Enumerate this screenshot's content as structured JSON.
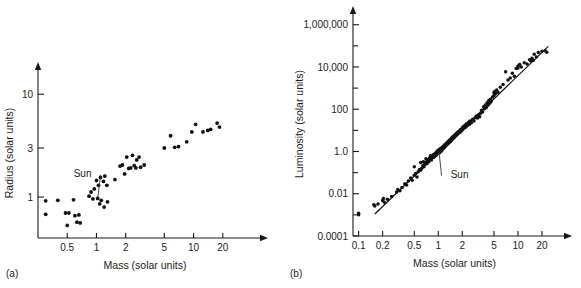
{
  "figure": {
    "panel_a_label": "(a)",
    "panel_b_label": "(b)"
  },
  "chart_data": [
    {
      "id": "panel-a",
      "type": "scatter",
      "title": "",
      "xlabel": "Mass (solar units)",
      "ylabel": "Radius (solar units)",
      "xscale": "log",
      "yscale": "log",
      "xlim": [
        0.25,
        40
      ],
      "ylim": [
        0.4,
        18
      ],
      "xticks": [
        0.5,
        1,
        2,
        5,
        10,
        20
      ],
      "xticklabels": [
        "0.5",
        "1",
        "2",
        "5",
        "10",
        "20"
      ],
      "yticks": [
        1,
        3,
        10
      ],
      "yticklabels": [
        "1",
        "3",
        "10"
      ],
      "grid": false,
      "legend": "none",
      "annotations": [
        {
          "text": "Sun",
          "x": 0.72,
          "y": 1.72,
          "point_x": 1.03,
          "point_y": 0.97
        }
      ],
      "points": [
        [
          0.3,
          0.92
        ],
        [
          0.3,
          0.68
        ],
        [
          0.4,
          0.93
        ],
        [
          0.48,
          0.7
        ],
        [
          0.5,
          0.53
        ],
        [
          0.52,
          0.7
        ],
        [
          0.58,
          0.94
        ],
        [
          0.6,
          0.66
        ],
        [
          0.63,
          0.57
        ],
        [
          0.66,
          0.67
        ],
        [
          0.68,
          0.56
        ],
        [
          0.84,
          1.02
        ],
        [
          0.88,
          1.12
        ],
        [
          0.92,
          0.96
        ],
        [
          0.95,
          1.2
        ],
        [
          1.0,
          1.45
        ],
        [
          1.03,
          0.97
        ],
        [
          1.05,
          1.3
        ],
        [
          1.08,
          0.86
        ],
        [
          1.1,
          1.55
        ],
        [
          1.12,
          0.93
        ],
        [
          1.18,
          1.42
        ],
        [
          1.2,
          0.8
        ],
        [
          1.22,
          1.6
        ],
        [
          1.28,
          1.3
        ],
        [
          1.3,
          0.9
        ],
        [
          1.55,
          1.48
        ],
        [
          1.75,
          2.0
        ],
        [
          1.85,
          2.05
        ],
        [
          1.95,
          1.68
        ],
        [
          2.05,
          2.45
        ],
        [
          2.15,
          1.9
        ],
        [
          2.25,
          1.92
        ],
        [
          2.35,
          2.55
        ],
        [
          2.45,
          2.02
        ],
        [
          2.55,
          1.92
        ],
        [
          2.6,
          2.3
        ],
        [
          2.75,
          2.45
        ],
        [
          2.85,
          1.95
        ],
        [
          3.1,
          2.05
        ],
        [
          5.0,
          3.0
        ],
        [
          5.8,
          3.95
        ],
        [
          6.4,
          3.05
        ],
        [
          7.0,
          3.1
        ],
        [
          8.5,
          3.45
        ],
        [
          9.6,
          4.3
        ],
        [
          10.5,
          5.1
        ],
        [
          12.5,
          4.3
        ],
        [
          14.0,
          4.45
        ],
        [
          15.0,
          4.55
        ],
        [
          17.5,
          5.25
        ],
        [
          18.5,
          4.8
        ]
      ]
    },
    {
      "id": "panel-b",
      "type": "scatter",
      "title": "",
      "xlabel": "Mass (solar units)",
      "ylabel": "Luminosity (solar units)",
      "xscale": "log",
      "yscale": "log",
      "xlim": [
        0.085,
        30
      ],
      "ylim": [
        0.0001,
        4000000
      ],
      "xticks": [
        0.1,
        0.2,
        0.5,
        1,
        2,
        5,
        10,
        20
      ],
      "xticklabels": [
        "0.1",
        "0.2",
        "0.5",
        "1",
        "2",
        "5",
        "10",
        "20"
      ],
      "yticks": [
        0.0001,
        0.01,
        1.0,
        100,
        10000,
        1000000
      ],
      "yticklabels": [
        "0.0001",
        "0.01",
        "1.0",
        "100",
        "10,000",
        "1,000,000"
      ],
      "yminorticks": [
        0.001,
        0.1,
        10,
        1000,
        100000
      ],
      "grid": false,
      "legend": "none",
      "fit_line": {
        "x1": 0.16,
        "y1": 0.0011,
        "x2": 24.0,
        "y2": 95000
      },
      "annotations": [
        {
          "text": "Sun",
          "x": 1.85,
          "y": 0.09,
          "point_x": 1.02,
          "point_y": 1.0
        }
      ],
      "points": [
        [
          0.1,
          0.0012
        ],
        [
          0.1,
          0.001
        ],
        [
          0.155,
          0.003
        ],
        [
          0.16,
          0.0026
        ],
        [
          0.175,
          0.0033
        ],
        [
          0.2,
          0.0048
        ],
        [
          0.205,
          0.006
        ],
        [
          0.21,
          0.004
        ],
        [
          0.23,
          0.0055
        ],
        [
          0.26,
          0.0075
        ],
        [
          0.3,
          0.012
        ],
        [
          0.31,
          0.016
        ],
        [
          0.33,
          0.014
        ],
        [
          0.35,
          0.02
        ],
        [
          0.38,
          0.03
        ],
        [
          0.4,
          0.026
        ],
        [
          0.42,
          0.04
        ],
        [
          0.45,
          0.055
        ],
        [
          0.47,
          0.044
        ],
        [
          0.5,
          0.075
        ],
        [
          0.5,
          0.19
        ],
        [
          0.52,
          0.09
        ],
        [
          0.54,
          0.062
        ],
        [
          0.56,
          0.11
        ],
        [
          0.58,
          0.14
        ],
        [
          0.6,
          0.13
        ],
        [
          0.6,
          0.3
        ],
        [
          0.62,
          0.16
        ],
        [
          0.64,
          0.22
        ],
        [
          0.65,
          0.33
        ],
        [
          0.66,
          0.19
        ],
        [
          0.68,
          0.26
        ],
        [
          0.7,
          0.3
        ],
        [
          0.7,
          0.45
        ],
        [
          0.72,
          0.26
        ],
        [
          0.73,
          0.38
        ],
        [
          0.75,
          0.42
        ],
        [
          0.76,
          0.33
        ],
        [
          0.78,
          0.5
        ],
        [
          0.8,
          0.46
        ],
        [
          0.8,
          0.62
        ],
        [
          0.82,
          0.4
        ],
        [
          0.83,
          0.56
        ],
        [
          0.85,
          0.6
        ],
        [
          0.86,
          0.7
        ],
        [
          0.87,
          0.52
        ],
        [
          0.88,
          0.66
        ],
        [
          0.9,
          0.78
        ],
        [
          0.9,
          0.58
        ],
        [
          0.92,
          0.72
        ],
        [
          0.93,
          0.85
        ],
        [
          0.94,
          0.64
        ],
        [
          0.95,
          0.9
        ],
        [
          0.96,
          0.76
        ],
        [
          0.97,
          1.05
        ],
        [
          0.98,
          0.82
        ],
        [
          1.0,
          0.95
        ],
        [
          1.0,
          1.15
        ],
        [
          1.02,
          1.0
        ],
        [
          1.03,
          1.25
        ],
        [
          1.04,
          0.88
        ],
        [
          1.05,
          1.1
        ],
        [
          1.06,
          1.35
        ],
        [
          1.08,
          1.2
        ],
        [
          1.1,
          1.45
        ],
        [
          1.1,
          1.05
        ],
        [
          1.12,
          1.55
        ],
        [
          1.14,
          1.3
        ],
        [
          1.15,
          1.7
        ],
        [
          1.16,
          1.4
        ],
        [
          1.18,
          1.85
        ],
        [
          1.2,
          1.6
        ],
        [
          1.2,
          2.1
        ],
        [
          1.22,
          1.75
        ],
        [
          1.25,
          2.3
        ],
        [
          1.26,
          1.95
        ],
        [
          1.28,
          2.6
        ],
        [
          1.3,
          2.2
        ],
        [
          1.32,
          2.9
        ],
        [
          1.34,
          2.45
        ],
        [
          1.36,
          3.2
        ],
        [
          1.38,
          2.7
        ],
        [
          1.4,
          3.6
        ],
        [
          1.42,
          3.0
        ],
        [
          1.45,
          4.0
        ],
        [
          1.46,
          3.3
        ],
        [
          1.48,
          4.5
        ],
        [
          1.5,
          3.8
        ],
        [
          1.52,
          5.0
        ],
        [
          1.55,
          4.2
        ],
        [
          1.58,
          5.6
        ],
        [
          1.6,
          4.8
        ],
        [
          1.62,
          6.2
        ],
        [
          1.65,
          5.4
        ],
        [
          1.68,
          7.0
        ],
        [
          1.7,
          6.0
        ],
        [
          1.72,
          7.8
        ],
        [
          1.75,
          6.8
        ],
        [
          1.78,
          8.5
        ],
        [
          1.8,
          7.5
        ],
        [
          1.85,
          9.5
        ],
        [
          1.88,
          8.2
        ],
        [
          1.9,
          11.0
        ],
        [
          1.95,
          9.5
        ],
        [
          2.0,
          13.0
        ],
        [
          2.0,
          10.5
        ],
        [
          2.05,
          15.0
        ],
        [
          2.1,
          12.5
        ],
        [
          2.15,
          17.0
        ],
        [
          2.2,
          14.0
        ],
        [
          2.25,
          20.0
        ],
        [
          2.3,
          16.5
        ],
        [
          2.4,
          24.0
        ],
        [
          2.45,
          19.0
        ],
        [
          2.5,
          28.0
        ],
        [
          2.6,
          23.0
        ],
        [
          2.7,
          34.0
        ],
        [
          2.8,
          28.0
        ],
        [
          2.9,
          40.0
        ],
        [
          3.0,
          48.0
        ],
        [
          3.1,
          38.0
        ],
        [
          3.2,
          55.0
        ],
        [
          3.3,
          44.0
        ],
        [
          3.4,
          65.0
        ],
        [
          3.5,
          90.0
        ],
        [
          3.6,
          75.0
        ],
        [
          3.7,
          130.0
        ],
        [
          3.8,
          105.0
        ],
        [
          3.9,
          160.0
        ],
        [
          4.0,
          120.0
        ],
        [
          4.1,
          200.0
        ],
        [
          4.2,
          155.0
        ],
        [
          4.3,
          260.0
        ],
        [
          4.4,
          190.0
        ],
        [
          4.5,
          300.0
        ],
        [
          4.6,
          230.0
        ],
        [
          4.8,
          380.0
        ],
        [
          5.0,
          600.0
        ],
        [
          5.0,
          450.0
        ],
        [
          5.1,
          700.0
        ],
        [
          5.2,
          550.0
        ],
        [
          5.4,
          820.0
        ],
        [
          5.6,
          640.0
        ],
        [
          6.0,
          1100.0
        ],
        [
          6.5,
          1500.0
        ],
        [
          7.0,
          6000.0
        ],
        [
          7.5,
          2400.0
        ],
        [
          8.0,
          3000.0
        ],
        [
          8.5,
          5000.0
        ],
        [
          9.0,
          3600.0
        ],
        [
          9.5,
          8500.0
        ],
        [
          10.0,
          11000.0
        ],
        [
          10.0,
          9000.0
        ],
        [
          10.5,
          13000.0
        ],
        [
          11.0,
          10000.0
        ],
        [
          12.0,
          16000.0
        ],
        [
          13.0,
          14000.0
        ],
        [
          14.0,
          22000.0
        ],
        [
          14.5,
          19000.0
        ],
        [
          15.0,
          26000.0
        ],
        [
          15.5,
          20000.0
        ],
        [
          16.0,
          40000.0
        ],
        [
          17.0,
          30000.0
        ],
        [
          18.0,
          48000.0
        ],
        [
          20.0,
          55000.0
        ],
        [
          22.0,
          58000.0
        ],
        [
          23.0,
          50000.0
        ]
      ]
    }
  ]
}
